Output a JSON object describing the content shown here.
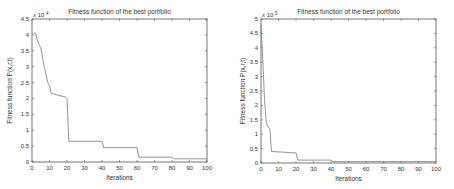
{
  "chart_data": [
    {
      "type": "line",
      "title": "Fitness function of the best portfolio",
      "xlabel": "Iterations",
      "ylabel": "Fitness function P(x,r,t)",
      "y_multiplier": "x 10^4",
      "y_multiplier_base": "x 10",
      "y_multiplier_exp": "4",
      "xlim": [
        0,
        100
      ],
      "ylim": [
        0,
        4.5
      ],
      "xticks": [
        0,
        10,
        20,
        30,
        40,
        50,
        60,
        70,
        80,
        90,
        100
      ],
      "yticks": [
        0,
        0.5,
        1,
        1.5,
        2,
        2.5,
        3,
        3.5,
        4,
        4.5
      ],
      "ytick_labels": [
        "0",
        "0.5",
        "1",
        "1.5",
        "2",
        "2.5",
        "3",
        "3.5",
        "4",
        "4.5"
      ],
      "grid": false,
      "x": [
        1,
        2,
        3,
        4,
        5,
        6,
        7,
        8,
        9,
        10,
        11,
        12,
        15,
        19,
        20,
        21,
        40,
        41,
        60,
        61,
        80,
        81,
        100
      ],
      "y": [
        4.05,
        4.05,
        3.85,
        3.7,
        3.6,
        3.3,
        3.0,
        2.75,
        2.5,
        2.4,
        2.15,
        2.15,
        2.1,
        2.05,
        2.0,
        0.65,
        0.65,
        0.45,
        0.45,
        0.15,
        0.15,
        0.1,
        0.1
      ]
    },
    {
      "type": "line",
      "title": "Fitness function of the best portfolio",
      "xlabel": "Iterations",
      "ylabel": "Fitness function P(x,r,t)",
      "y_multiplier": "x 10^5",
      "y_multiplier_base": "x 10",
      "y_multiplier_exp": "5",
      "xlim": [
        0,
        100
      ],
      "ylim": [
        0,
        5
      ],
      "xticks": [
        0,
        10,
        20,
        30,
        40,
        50,
        60,
        70,
        80,
        90,
        100
      ],
      "yticks": [
        0,
        0.5,
        1,
        1.5,
        2,
        2.5,
        3,
        3.5,
        4,
        4.5,
        5
      ],
      "ytick_labels": [
        "0",
        "0.5",
        "1",
        "1.5",
        "2",
        "2.5",
        "3",
        "3.5",
        "4",
        "4.5",
        "5"
      ],
      "grid": false,
      "x": [
        0,
        1,
        2,
        3,
        4,
        5,
        6,
        20,
        21,
        40,
        41,
        100
      ],
      "y": [
        4.8,
        3.6,
        2.2,
        1.4,
        1.25,
        1.2,
        0.4,
        0.35,
        0.1,
        0.1,
        0.05,
        0.05
      ]
    }
  ]
}
